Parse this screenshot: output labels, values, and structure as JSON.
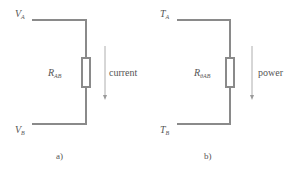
{
  "diagrams": [
    {
      "caption": "a)",
      "top_label": {
        "main": "V",
        "sub": "A"
      },
      "bottom_label": {
        "main": "V",
        "sub": "B"
      },
      "resistor_label": {
        "main": "R",
        "sub": "AB"
      },
      "flow_label": "current"
    },
    {
      "caption": "b)",
      "top_label": {
        "main": "T",
        "sub": "A"
      },
      "bottom_label": {
        "main": "T",
        "sub": "B"
      },
      "resistor_label": {
        "main": "R",
        "sub": "θAB"
      },
      "flow_label": "power"
    }
  ],
  "colors": {
    "wire": "#8a8a8a",
    "text": "#555555",
    "arrow": "#9a9a9a"
  }
}
